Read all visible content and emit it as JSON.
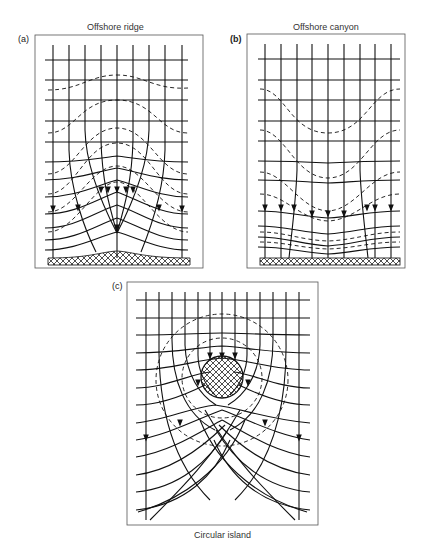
{
  "figure": {
    "panels": [
      {
        "id": "a",
        "label": "(a)",
        "title": "Offshore ridge"
      },
      {
        "id": "b",
        "label": "(b)",
        "title": "Offshore canyon"
      },
      {
        "id": "c",
        "label": "(c)",
        "title": "Circular island"
      }
    ],
    "legend_semantics": {
      "solid_horizontal": "wave crests",
      "solid_vertical_with_arrows": "wave orthogonals",
      "dashed": "depth contours",
      "crosshatch": "land / shoreline"
    }
  }
}
